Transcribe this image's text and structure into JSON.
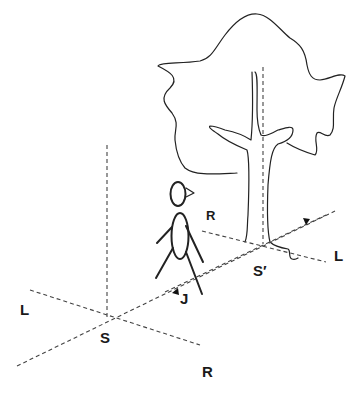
{
  "diagram": {
    "labels": {
      "S": "S",
      "S_prime": "S′",
      "L_near": "L",
      "R_near": "R",
      "L_far": "L",
      "R_far": "R",
      "J": "J"
    },
    "elements": [
      "person",
      "tree",
      "origin-S",
      "origin-S-prime",
      "axis-LR-near",
      "axis-LR-far",
      "axis-S-S-prime",
      "vertical-axis-S",
      "vertical-axis-S-prime",
      "arrow-J",
      "arrow-far"
    ],
    "colors": {
      "line": "#222222",
      "dashed": "#444444",
      "background": "#ffffff"
    }
  }
}
